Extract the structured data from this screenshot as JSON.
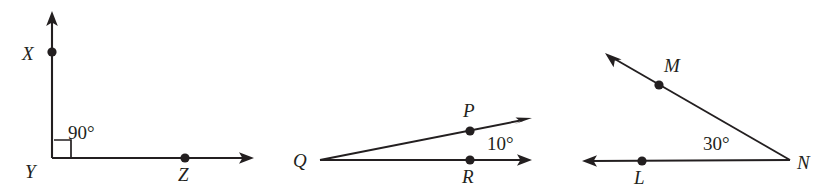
{
  "figure": {
    "background_color": "#ffffff",
    "ink_color": "#231f20",
    "width": 836,
    "height": 194
  },
  "diagrams": [
    {
      "id": "angle-xyz",
      "angle_label": "90°",
      "vertex_label": "Y",
      "points": [
        {
          "label": "X",
          "x": 52,
          "y": 52,
          "label_x": 22,
          "label_y": 60
        },
        {
          "label": "Y",
          "x": 52,
          "y": 158,
          "label_x": 25,
          "label_y": 178
        },
        {
          "label": "Z",
          "x": 185,
          "y": 158,
          "label_x": 178,
          "label_y": 181
        }
      ],
      "rays": [
        {
          "name": "ray-yx",
          "x1": 52,
          "y1": 158,
          "x2": 52,
          "y2": 19
        },
        {
          "name": "ray-yz",
          "x1": 52,
          "y1": 158,
          "x2": 246,
          "y2": 158
        }
      ],
      "arrows": [
        {
          "name": "arrow-yx",
          "tip_x": 52,
          "tip_y": 11,
          "dir": "up"
        },
        {
          "name": "arrow-yz",
          "tip_x": 254,
          "tip_y": 158,
          "dir": "right"
        }
      ],
      "right_angle_mark": {
        "x": 54,
        "y": 140,
        "size": 17
      },
      "angle_label_pos": {
        "x": 68,
        "y": 139
      }
    },
    {
      "id": "angle-pqr",
      "angle_label": "10°",
      "vertex_label": "Q",
      "points": [
        {
          "label": "Q",
          "x": 320,
          "y": 160,
          "label_x": 293,
          "label_y": 167
        },
        {
          "label": "P",
          "x": 470,
          "y": 131,
          "label_x": 463,
          "label_y": 117
        },
        {
          "label": "R",
          "x": 470,
          "y": 160,
          "label_x": 462,
          "label_y": 183
        }
      ],
      "rays": [
        {
          "name": "ray-qp",
          "x1": 320,
          "y1": 160,
          "x2": 523,
          "y2": 120
        },
        {
          "name": "ray-qr",
          "x1": 320,
          "y1": 160,
          "x2": 523,
          "y2": 160
        }
      ],
      "arrows": [
        {
          "name": "arrow-qp",
          "tip_x": 532,
          "tip_y": 118,
          "dir": "right-up"
        },
        {
          "name": "arrow-qr",
          "tip_x": 532,
          "tip_y": 160,
          "dir": "right"
        }
      ],
      "angle_label_pos": {
        "x": 487,
        "y": 150
      }
    },
    {
      "id": "angle-mnl",
      "angle_label": "30°",
      "vertex_label": "N",
      "points": [
        {
          "label": "M",
          "x": 659,
          "y": 85,
          "label_x": 664,
          "label_y": 72
        },
        {
          "label": "N",
          "x": 790,
          "y": 160,
          "label_x": 797,
          "label_y": 169
        },
        {
          "label": "L",
          "x": 642,
          "y": 161,
          "label_x": 634,
          "label_y": 184
        }
      ],
      "rays": [
        {
          "name": "ray-nm",
          "x1": 790,
          "y1": 160,
          "x2": 613,
          "y2": 58
        },
        {
          "name": "ray-nl",
          "x1": 790,
          "y1": 160,
          "x2": 590,
          "y2": 161
        }
      ],
      "arrows": [
        {
          "name": "arrow-nm",
          "tip_x": 605,
          "tip_y": 53,
          "dir": "left-up"
        },
        {
          "name": "arrow-nl",
          "tip_x": 582,
          "tip_y": 161,
          "dir": "left"
        }
      ],
      "angle_label_pos": {
        "x": 703,
        "y": 150
      }
    }
  ]
}
